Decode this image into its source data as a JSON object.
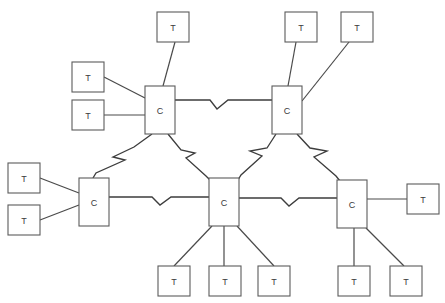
{
  "diagram": {
    "type": "star-of-stars network topology",
    "background_color": "#ffffff",
    "line_color": "#4a4a4a",
    "node_fill_color": "#ffffff",
    "node_stroke_color": "#5b5b5b",
    "label_color": "#3a3a3a",
    "concentrator_label": "C",
    "terminal_label": "T",
    "concentrator_count": 5,
    "terminal_count": 12,
    "trunk_link_count": 6,
    "nodes": [
      {
        "id": "c-upper-left",
        "label": "C",
        "kind": "concentrator",
        "x": 145,
        "y": 86,
        "w": 30,
        "h": 48
      },
      {
        "id": "c-upper-right",
        "label": "C",
        "kind": "concentrator",
        "x": 272,
        "y": 86,
        "w": 30,
        "h": 48
      },
      {
        "id": "c-left",
        "label": "C",
        "kind": "concentrator",
        "x": 79,
        "y": 178,
        "w": 30,
        "h": 48
      },
      {
        "id": "c-center",
        "label": "C",
        "kind": "concentrator",
        "x": 209,
        "y": 178,
        "w": 30,
        "h": 48
      },
      {
        "id": "c-right",
        "label": "C",
        "kind": "concentrator",
        "x": 337,
        "y": 180,
        "w": 30,
        "h": 48
      },
      {
        "id": "t-top-center",
        "label": "T",
        "kind": "terminal",
        "x": 157,
        "y": 12,
        "w": 32,
        "h": 30
      },
      {
        "id": "t-top-right-a",
        "label": "T",
        "kind": "terminal",
        "x": 285,
        "y": 12,
        "w": 32,
        "h": 30
      },
      {
        "id": "t-top-right-b",
        "label": "T",
        "kind": "terminal",
        "x": 341,
        "y": 12,
        "w": 32,
        "h": 30
      },
      {
        "id": "t-upper-left-a",
        "label": "T",
        "kind": "terminal",
        "x": 72,
        "y": 62,
        "w": 32,
        "h": 30
      },
      {
        "id": "t-upper-left-b",
        "label": "T",
        "kind": "terminal",
        "x": 72,
        "y": 100,
        "w": 32,
        "h": 30
      },
      {
        "id": "t-left-a",
        "label": "T",
        "kind": "terminal",
        "x": 8,
        "y": 163,
        "w": 32,
        "h": 30
      },
      {
        "id": "t-left-b",
        "label": "T",
        "kind": "terminal",
        "x": 8,
        "y": 205,
        "w": 32,
        "h": 30
      },
      {
        "id": "t-right",
        "label": "T",
        "kind": "terminal",
        "x": 407,
        "y": 184,
        "w": 32,
        "h": 30
      },
      {
        "id": "t-bottom-a",
        "label": "T",
        "kind": "terminal",
        "x": 158,
        "y": 266,
        "w": 32,
        "h": 30
      },
      {
        "id": "t-bottom-b",
        "label": "T",
        "kind": "terminal",
        "x": 209,
        "y": 266,
        "w": 32,
        "h": 30
      },
      {
        "id": "t-bottom-c",
        "label": "T",
        "kind": "terminal",
        "x": 258,
        "y": 266,
        "w": 32,
        "h": 30
      },
      {
        "id": "t-bottom-d",
        "label": "T",
        "kind": "terminal",
        "x": 338,
        "y": 266,
        "w": 32,
        "h": 30
      },
      {
        "id": "t-bottom-e",
        "label": "T",
        "kind": "terminal",
        "x": 390,
        "y": 266,
        "w": 32,
        "h": 30
      }
    ],
    "terminal_links": [
      {
        "id": "link-t-top-center",
        "from": "t-top-center",
        "to": "c-upper-left",
        "points": "175,42 163,86"
      },
      {
        "id": "link-t-upper-left-a",
        "from": "t-upper-left-a",
        "to": "c-upper-left",
        "points": "104,77 145,98"
      },
      {
        "id": "link-t-upper-left-b",
        "from": "t-upper-left-b",
        "to": "c-upper-left",
        "points": "104,115 145,115"
      },
      {
        "id": "link-t-top-right-a",
        "from": "t-top-right-a",
        "to": "c-upper-right",
        "points": "296,42 288,86"
      },
      {
        "id": "link-t-top-right-b",
        "from": "t-top-right-b",
        "to": "c-upper-right",
        "points": "349,42 302,101"
      },
      {
        "id": "link-t-left-a",
        "from": "t-left-a",
        "to": "c-left",
        "points": "40,178 79,193"
      },
      {
        "id": "link-t-left-b",
        "from": "t-left-b",
        "to": "c-left",
        "points": "40,220 79,205"
      },
      {
        "id": "link-t-right",
        "from": "t-right",
        "to": "c-right",
        "points": "367,199 407,199"
      },
      {
        "id": "link-t-bottom-a",
        "from": "t-bottom-a",
        "to": "c-center",
        "points": "174,266 212,226"
      },
      {
        "id": "link-t-bottom-b",
        "from": "t-bottom-b",
        "to": "c-center",
        "points": "224,266 224,226"
      },
      {
        "id": "link-t-bottom-c",
        "from": "t-bottom-c",
        "to": "c-center",
        "points": "274,266 237,226"
      },
      {
        "id": "link-t-bottom-d",
        "from": "t-bottom-d",
        "to": "c-right",
        "points": "354,266 354,228"
      },
      {
        "id": "link-t-bottom-e",
        "from": "t-bottom-e",
        "to": "c-right",
        "points": "404,266 366,228"
      }
    ],
    "trunk_links": [
      {
        "id": "trunk-upper-left-to-upper-right",
        "from": "c-upper-left",
        "to": "c-upper-right",
        "style": "zigzag-break"
      },
      {
        "id": "trunk-upper-left-to-left",
        "from": "c-upper-left",
        "to": "c-left",
        "style": "zigzag-break"
      },
      {
        "id": "trunk-upper-left-to-center",
        "from": "c-upper-left",
        "to": "c-center",
        "style": "zigzag-break"
      },
      {
        "id": "trunk-upper-right-to-center",
        "from": "c-upper-right",
        "to": "c-center",
        "style": "zigzag-break"
      },
      {
        "id": "trunk-upper-right-to-right",
        "from": "c-upper-right",
        "to": "c-right",
        "style": "zigzag-break"
      },
      {
        "id": "trunk-left-to-center",
        "from": "c-left",
        "to": "c-center",
        "style": "zigzag-break"
      },
      {
        "id": "trunk-center-to-right",
        "from": "c-center",
        "to": "c-right",
        "style": "zigzag-break"
      }
    ]
  }
}
